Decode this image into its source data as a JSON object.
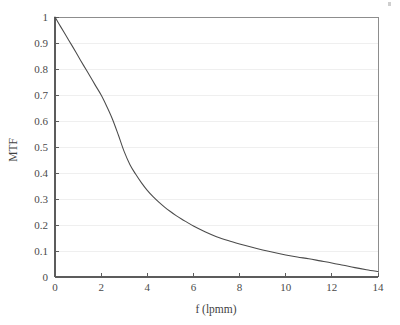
{
  "figure": {
    "background_color": "#ffffff",
    "curve_color": "#4b4b4b",
    "grid_color": "#ededed",
    "axis_color": "#5c5c5c",
    "corner_speck_name": "scan-artifact"
  },
  "chart_data": {
    "type": "line",
    "title": "",
    "xlabel": "f (lpmm)",
    "ylabel": "MTF",
    "xlim": [
      0,
      14
    ],
    "ylim": [
      0,
      1
    ],
    "grid": true,
    "legend": null,
    "xticks": [
      0,
      2,
      4,
      6,
      8,
      10,
      12,
      14
    ],
    "xtick_labels": [
      "0",
      "2",
      "4",
      "6",
      "8",
      "10",
      "12",
      "14"
    ],
    "yticks": [
      0,
      0.1,
      0.2,
      0.3,
      0.4,
      0.5,
      0.6,
      0.7,
      0.8,
      0.9,
      1
    ],
    "ytick_labels": [
      "0",
      "0.1",
      "0.2",
      "0.3",
      "0.4",
      "0.5",
      "0.6",
      "0.7",
      "0.8",
      "0.9",
      "1"
    ],
    "series": [
      {
        "name": "MTF",
        "x": [
          0,
          0.25,
          0.5,
          0.75,
          1,
          1.25,
          1.5,
          1.75,
          2,
          2.25,
          2.5,
          2.75,
          3,
          3.25,
          3.5,
          3.75,
          4,
          4.25,
          4.5,
          4.75,
          5,
          5.25,
          5.5,
          5.75,
          6,
          6.5,
          7,
          7.5,
          8,
          8.5,
          9,
          9.5,
          10,
          10.5,
          11,
          11.5,
          12,
          12.5,
          13,
          13.5,
          14
        ],
        "y": [
          1.0,
          0.962,
          0.925,
          0.888,
          0.85,
          0.812,
          0.775,
          0.737,
          0.7,
          0.655,
          0.605,
          0.545,
          0.482,
          0.432,
          0.395,
          0.362,
          0.333,
          0.309,
          0.288,
          0.269,
          0.252,
          0.236,
          0.222,
          0.209,
          0.196,
          0.174,
          0.155,
          0.14,
          0.127,
          0.115,
          0.104,
          0.094,
          0.085,
          0.077,
          0.07,
          0.062,
          0.054,
          0.045,
          0.036,
          0.028,
          0.021
        ]
      }
    ]
  }
}
